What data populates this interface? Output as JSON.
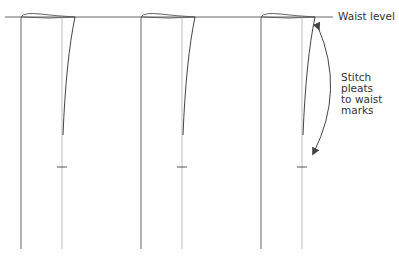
{
  "diagram": {
    "title": "",
    "labels": {
      "waist_level": "Waist level",
      "stitch_note": "Stitch\npleats\nto waist\nmarks"
    },
    "colors": {
      "line": "#555555",
      "light_line": "#aaaaaa",
      "text": "#333333",
      "background": "#ffffff"
    },
    "strips": [
      {
        "id": "strip-1",
        "left_x": 21,
        "right_x": 62,
        "fold_top_x": 75
      },
      {
        "id": "strip-2",
        "left_x": 141,
        "right_x": 182,
        "fold_top_x": 195
      },
      {
        "id": "strip-3",
        "left_x": 261,
        "right_x": 302,
        "fold_top_x": 315
      }
    ],
    "waist_y": 17,
    "bottom_y": 249,
    "mark_y": 167
  }
}
